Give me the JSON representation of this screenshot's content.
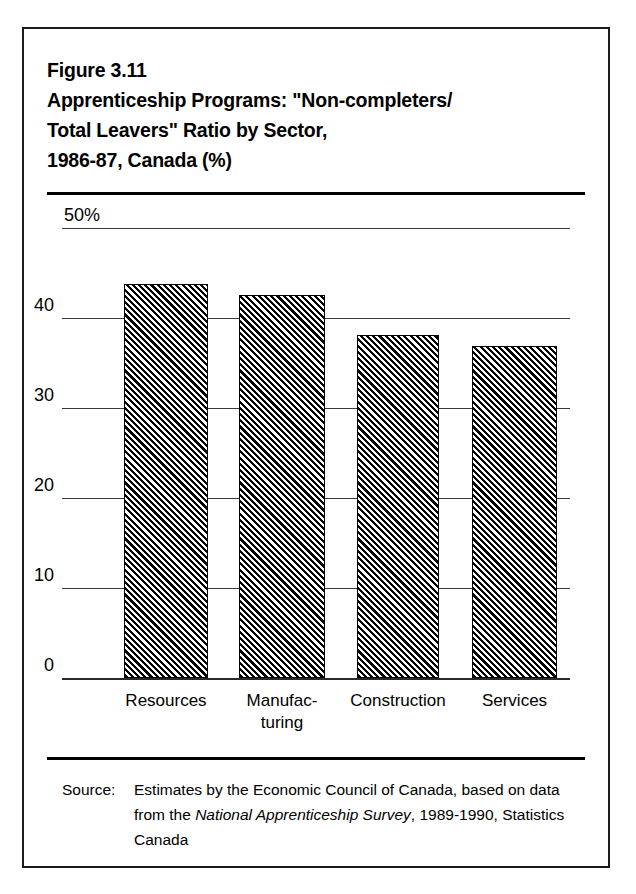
{
  "figure": {
    "title_lines": [
      "Figure 3.11",
      "Apprenticeship Programs: \"Non-completers/",
      "Total Leavers\" Ratio by Sector,",
      "1986-87, Canada (%)"
    ],
    "source_label": "Source:",
    "source_text_part1": "Estimates by the Economic Council of Canada, based on data from the ",
    "source_text_italic": "National Apprenticeship Survey",
    "source_text_part2": ", 1989-1990, Statistics Canada"
  },
  "chart_data": {
    "type": "bar",
    "categories": [
      "Resources",
      "Manufac-\nturing",
      "Construction",
      "Services"
    ],
    "category_plain": [
      "Resources",
      "Manufacturing",
      "Construction",
      "Services"
    ],
    "values": [
      43.8,
      42.6,
      38.1,
      36.9
    ],
    "xlabel": "",
    "ylabel": "",
    "ylim": [
      0,
      50
    ],
    "yticks": [
      0,
      10,
      20,
      30,
      40,
      50
    ],
    "ytick_labels": [
      "0",
      "10",
      "20",
      "30",
      "40",
      "50%"
    ],
    "grid": true,
    "legend": "none",
    "series_fill": "diagonal-hatch-black-white"
  },
  "colors": {
    "frame": "#1a1a1a",
    "rule": "#000000",
    "gridline": "#3a3a3a",
    "bar_hatch": "#000000",
    "background": "#ffffff"
  }
}
